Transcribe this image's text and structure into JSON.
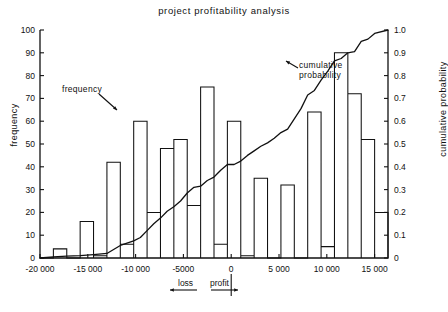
{
  "chart_data": {
    "type": "bar",
    "title": "project profitability analysis",
    "xlabel": "",
    "ylabel": "frequency",
    "y2label": "cumulative probability",
    "xlim": [
      -20000,
      16400
    ],
    "ylim": [
      0,
      100
    ],
    "y2lim": [
      0,
      1.0
    ],
    "grid": false,
    "legend_position": "none",
    "x_tick_labels": [
      "-20 000",
      "-15 000",
      "-10 000",
      "-5000",
      "0",
      "5 000",
      "10 000",
      "15 000"
    ],
    "x_tick_values": [
      -20000,
      -15000,
      -10000,
      -5000,
      0,
      5000,
      10000,
      15000
    ],
    "y_tick_labels": [
      "0",
      "10",
      "20",
      "30",
      "40",
      "50",
      "60",
      "70",
      "80",
      "90",
      "100"
    ],
    "y_tick_values": [
      0,
      10,
      20,
      30,
      40,
      50,
      60,
      70,
      80,
      90,
      100
    ],
    "y2_tick_labels": [
      "0",
      "0.1",
      "0.2",
      "0.3",
      "0.4",
      "0.5",
      "0.6",
      "0.7",
      "0.8",
      "0.9",
      "1.0"
    ],
    "y2_tick_values": [
      0,
      0.1,
      0.2,
      0.3,
      0.4,
      0.5,
      0.6,
      0.7,
      0.8,
      0.9,
      1.0
    ],
    "bin_width": 1400,
    "bin_starts": [
      -18600,
      -17200,
      -15800,
      -14400,
      -13000,
      -11600,
      -10200,
      -8800,
      -7400,
      -6000,
      -4600,
      -3200,
      -1800,
      -400,
      1000,
      2400,
      3800,
      5200,
      6600,
      8000,
      9400,
      10800,
      12200,
      13600,
      15000
    ],
    "categories": [
      "-18600",
      "-17200",
      "-15800",
      "-14400",
      "-13000",
      "-11600",
      "-10200",
      "-8800",
      "-7400",
      "-6000",
      "-4600",
      "-3200",
      "-1800",
      "-400",
      "1000",
      "2400",
      "3800",
      "5200",
      "6600",
      "8000",
      "9400",
      "10800",
      "12200",
      "13600",
      "15000"
    ],
    "values": [
      4,
      0,
      16,
      1,
      42,
      6,
      60,
      20,
      48,
      52,
      23,
      75,
      6,
      60,
      1,
      35,
      0,
      32,
      0,
      64,
      5,
      90,
      72,
      52,
      20
    ],
    "series": [
      {
        "name": "frequency",
        "type": "bar",
        "axis": "left",
        "values": [
          4,
          0,
          16,
          1,
          42,
          6,
          60,
          20,
          48,
          52,
          23,
          75,
          6,
          60,
          1,
          35,
          0,
          32,
          0,
          64,
          5,
          90,
          72,
          52,
          20
        ]
      },
      {
        "name": "cumulative probability",
        "type": "line",
        "axis": "right",
        "x": [
          -20000,
          -18600,
          -17200,
          -15800,
          -14400,
          -13000,
          -11600,
          -10200,
          -9500,
          -8800,
          -8100,
          -7400,
          -6700,
          -6000,
          -5300,
          -4600,
          -3900,
          -3200,
          -2500,
          -1800,
          -1100,
          -400,
          300,
          1000,
          1700,
          2400,
          3100,
          3800,
          4500,
          5200,
          5900,
          6600,
          7300,
          8000,
          8700,
          9400,
          10100,
          10800,
          11500,
          12200,
          12900,
          13600,
          14300,
          15000,
          16400
        ],
        "y": [
          0.0,
          0.005,
          0.008,
          0.01,
          0.015,
          0.02,
          0.055,
          0.075,
          0.09,
          0.12,
          0.15,
          0.175,
          0.205,
          0.225,
          0.25,
          0.285,
          0.31,
          0.315,
          0.34,
          0.355,
          0.385,
          0.41,
          0.41,
          0.425,
          0.45,
          0.47,
          0.49,
          0.505,
          0.525,
          0.55,
          0.565,
          0.61,
          0.655,
          0.715,
          0.735,
          0.78,
          0.82,
          0.865,
          0.875,
          0.9,
          0.905,
          0.95,
          0.96,
          0.985,
          1.0
        ]
      }
    ],
    "annotations": [
      {
        "name": "frequency",
        "text": "frequency",
        "points_to": "histogram-bars"
      },
      {
        "name": "cumulative-probability",
        "text_line1": "cumulative",
        "text_line2": "probability",
        "points_to": "cumulative-curve"
      },
      {
        "name": "loss-direction",
        "text": "loss",
        "arrow": "left"
      },
      {
        "name": "profit-direction",
        "text": "profit",
        "arrow": "right"
      }
    ]
  },
  "axis_colors": {
    "line": "#111111",
    "background": "#ffffff"
  }
}
